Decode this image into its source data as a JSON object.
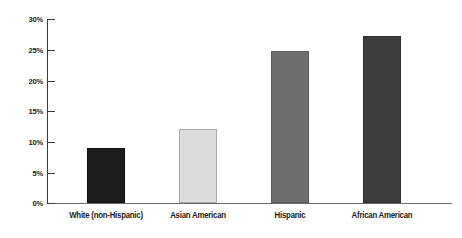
{
  "chart_data": {
    "type": "bar",
    "title": "",
    "subtitle": "",
    "xlabel": "",
    "ylabel": "",
    "categories": [
      "White (non-Hispanic)",
      "Asian American",
      "Hispanic",
      "African American"
    ],
    "values": [
      9,
      12,
      24.8,
      27.2
    ],
    "value_labels": [
      "9%",
      "12%",
      "24.8%",
      "27.2%"
    ],
    "series": [
      {
        "name": "",
        "values": [
          9,
          12,
          24.8,
          27.2
        ]
      }
    ],
    "ylim": [
      0,
      30
    ],
    "yticks": [
      0,
      5,
      10,
      15,
      20,
      25,
      30
    ],
    "ytick_labels": [
      "0%",
      "5%",
      "10%",
      "15%",
      "20%",
      "25%",
      "30%"
    ],
    "grid": false,
    "legend": null,
    "legend_position": "none",
    "bar_colors": [
      "#1c1c1c",
      "#dcdcdc",
      "#6e6e6e",
      "#3c3c3c"
    ],
    "bar_border_colors": [
      "#111111",
      "#a9a9a9",
      "#5a5a5a",
      "#2e2e2e"
    ],
    "axis_color": "#3a3a3a",
    "background_color": "#ffffff",
    "text_color": "#1a1a1a"
  },
  "axis": {
    "y_ticks": [
      {
        "label": "30%",
        "value": 30
      },
      {
        "label": "25%",
        "value": 25
      },
      {
        "label": "20%",
        "value": 20
      },
      {
        "label": "15%",
        "value": 15
      },
      {
        "label": "10%",
        "value": 10
      },
      {
        "label": "5%",
        "value": 5
      },
      {
        "label": "0%",
        "value": 0
      }
    ]
  },
  "bars": [
    {
      "label": "White (non-Hispanic)",
      "value": 9
    },
    {
      "label": "Asian American",
      "value": 12
    },
    {
      "label": "Hispanic",
      "value": 24.8
    },
    {
      "label": "African American",
      "value": 27.2
    }
  ]
}
